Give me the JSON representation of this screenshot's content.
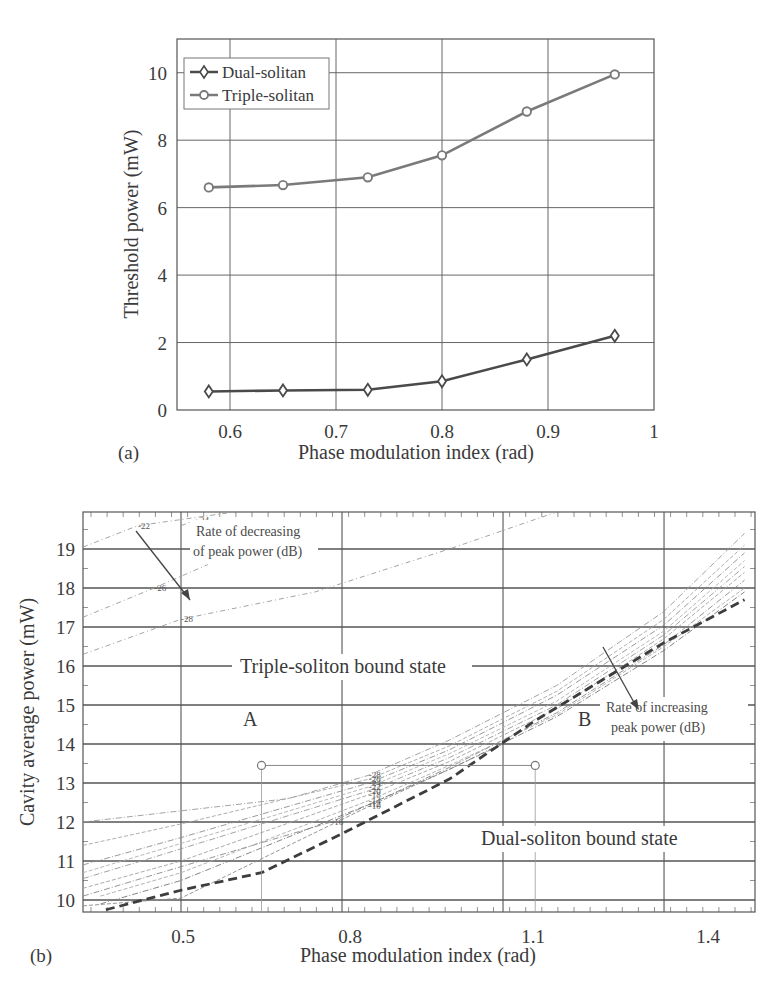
{
  "chart_data": [
    {
      "id": "a",
      "type": "line",
      "panel_label": "(a)",
      "title": "",
      "xlabel": "Phase modulation index (rad)",
      "ylabel": "Threshold power (mW)",
      "xlim": [
        0.55,
        1.0
      ],
      "ylim": [
        0,
        11
      ],
      "xticks": [
        "0.6",
        "0.7",
        "0.8",
        "0.9",
        "1"
      ],
      "yticks": [
        "0",
        "2",
        "4",
        "6",
        "8",
        "10"
      ],
      "grid": true,
      "legend_position": "upper left",
      "series": [
        {
          "name": "Dual-solitan",
          "marker": "diamond",
          "color": "#4a4a4a",
          "x": [
            0.58,
            0.65,
            0.73,
            0.8,
            0.88,
            0.963
          ],
          "y": [
            0.55,
            0.58,
            0.6,
            0.85,
            1.5,
            2.2
          ]
        },
        {
          "name": "Triple-solitan",
          "marker": "circle",
          "color": "#7a7a7a",
          "x": [
            0.58,
            0.65,
            0.73,
            0.8,
            0.88,
            0.963
          ],
          "y": [
            6.6,
            6.67,
            6.9,
            7.55,
            8.85,
            9.95
          ]
        }
      ]
    },
    {
      "id": "b",
      "type": "line",
      "panel_label": "(b)",
      "title": "",
      "xlabel": "Phase modulation index (rad)",
      "ylabel": "Cavity average power (mW)",
      "xlim": [
        0.3,
        1.55
      ],
      "ylim": [
        9.7,
        19.95
      ],
      "xticks": [
        "0.5",
        "0.8",
        "1.1",
        "1.4"
      ],
      "yticks": [
        "10",
        "11",
        "12",
        "13",
        "14",
        "15",
        "16",
        "17",
        "18",
        "19"
      ],
      "grid": true,
      "region_labels": [
        "Triple-soliton bound state",
        "Dual-soliton bound state"
      ],
      "annotations": [
        "Rate of decreasing of peak power (dB)",
        "Rate of increasing peak power (dB)",
        "A",
        "B"
      ],
      "points": [
        {
          "name": "A",
          "x": 0.65,
          "y": 13.45
        },
        {
          "name": "B",
          "x": 1.16,
          "y": 13.45
        }
      ],
      "series": [
        {
          "name": "Threshold boundary (dashed)",
          "style": "dashed-thick",
          "x": [
            0.36,
            0.5,
            0.65,
            0.8,
            1.0,
            1.16,
            1.4,
            1.55
          ],
          "y": [
            9.75,
            10.25,
            10.7,
            11.7,
            13.1,
            14.6,
            16.6,
            17.7
          ]
        }
      ],
      "contours_decreasing": [
        {
          "level": "-22",
          "x": [
            0.3,
            0.42,
            0.6
          ],
          "y": [
            19.05,
            19.6,
            20.1
          ]
        },
        {
          "level": "-24",
          "x": [
            0.5,
            0.53
          ],
          "y": [
            19.6,
            19.75
          ]
        },
        {
          "level": "-26",
          "x": [
            0.3,
            0.45,
            0.55
          ],
          "y": [
            17.25,
            18.0,
            18.6
          ]
        },
        {
          "level": "-28",
          "x": [
            0.3,
            0.5,
            0.75,
            1.0,
            1.2
          ],
          "y": [
            16.3,
            17.2,
            17.9,
            19.0,
            20.1
          ]
        }
      ],
      "contours_increasing": [
        {
          "level": "-28",
          "x": [
            0.3,
            0.7,
            0.85,
            1.0,
            1.2,
            1.4,
            1.55
          ],
          "y": [
            12.0,
            12.6,
            13.2,
            14.1,
            15.5,
            17.4,
            19.4
          ]
        },
        {
          "level": "-26",
          "x": [
            0.3,
            0.5,
            0.85,
            1.0,
            1.2,
            1.4,
            1.55
          ],
          "y": [
            11.4,
            11.95,
            13.1,
            13.95,
            15.35,
            17.2,
            19.1
          ]
        },
        {
          "level": "-24",
          "x": [
            0.3,
            0.5,
            0.85,
            1.0,
            1.2,
            1.4,
            1.55
          ],
          "y": [
            10.9,
            11.6,
            13.0,
            13.85,
            15.25,
            17.05,
            18.9
          ]
        },
        {
          "level": "-22",
          "x": [
            0.3,
            0.5,
            0.85,
            1.0,
            1.2,
            1.4,
            1.55
          ],
          "y": [
            10.7,
            11.45,
            12.9,
            13.75,
            15.1,
            16.9,
            18.7
          ]
        },
        {
          "level": "-20",
          "x": [
            0.3,
            0.45,
            0.85,
            1.0,
            1.2,
            1.4,
            1.55
          ],
          "y": [
            10.55,
            11.1,
            12.8,
            13.65,
            15.0,
            16.8,
            18.55
          ]
        },
        {
          "level": "-18",
          "x": [
            0.3,
            0.5,
            0.85,
            1.0,
            1.2,
            1.4,
            1.55
          ],
          "y": [
            10.3,
            11.0,
            12.7,
            13.55,
            14.9,
            16.7,
            18.4
          ]
        },
        {
          "level": "-16",
          "x": [
            0.3,
            0.45,
            0.78,
            1.0,
            1.2,
            1.4,
            1.55
          ],
          "y": [
            10.1,
            10.65,
            12.0,
            13.4,
            14.8,
            16.55,
            18.2
          ]
        },
        {
          "level": "-14",
          "x": [
            0.35,
            0.5,
            0.85,
            1.0,
            1.2,
            1.4,
            1.55
          ],
          "y": [
            10.1,
            10.7,
            12.55,
            13.45,
            14.75,
            16.5,
            18.0
          ]
        },
        {
          "level": "-12",
          "x": [
            0.35,
            0.5,
            0.85,
            1.0,
            1.2,
            1.4,
            1.55
          ],
          "y": [
            9.9,
            10.5,
            12.45,
            13.35,
            14.7,
            16.4,
            17.9
          ]
        },
        {
          "level": "-10",
          "x": [
            0.3,
            0.5,
            0.85,
            1.0,
            1.1
          ],
          "y": [
            9.85,
            10.05,
            12.4,
            13.35,
            14.0
          ]
        }
      ]
    }
  ],
  "figure": {
    "a": {
      "panel_label": "(a)",
      "xlabel": "Phase modulation index (rad)",
      "ylabel": "Threshold power (mW)",
      "legend": [
        "Dual-solitan",
        "Triple-solitan"
      ]
    },
    "b": {
      "panel_label": "(b)",
      "xlabel": "Phase modulation index (rad)",
      "ylabel": "Cavity average power (mW)",
      "region_triple": "Triple-soliton bound state",
      "region_dual": "Dual-soliton bound state",
      "anno_decreasing_1": "Rate of decreasing",
      "anno_decreasing_2": "of peak power (dB)",
      "anno_increasing_1": "Rate of increasing",
      "anno_increasing_2": "peak power (dB)",
      "point_a": "A",
      "point_b": "B"
    }
  }
}
